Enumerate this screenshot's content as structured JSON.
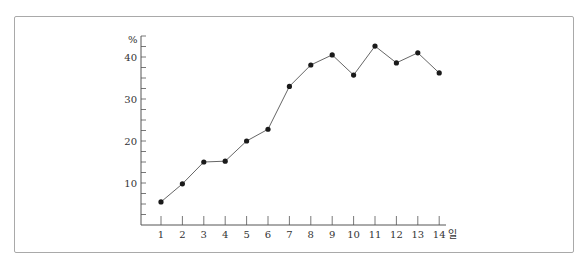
{
  "header": {
    "cut_text": ""
  },
  "chart_data": {
    "type": "line",
    "title": "",
    "xlabel": "일",
    "ylabel": "%",
    "x": [
      1,
      2,
      3,
      4,
      5,
      6,
      7,
      8,
      9,
      10,
      11,
      12,
      13,
      14
    ],
    "series": [
      {
        "name": "",
        "values": [
          5.5,
          9.8,
          15.0,
          15.2,
          20.0,
          22.8,
          33.0,
          38.1,
          40.5,
          35.7,
          42.6,
          38.6,
          41.0,
          36.2
        ]
      }
    ],
    "y_ticks": [
      10,
      20,
      30,
      40
    ],
    "x_tick_labels": [
      "1",
      "2",
      "3",
      "4",
      "5",
      "6",
      "7",
      "8",
      "9",
      "10",
      "11",
      "12",
      "13",
      "14"
    ],
    "ylim": [
      0,
      46
    ],
    "grid": false,
    "legend": "none",
    "minor_y_tick_step": 2.5
  },
  "colors": {
    "line": "#666666",
    "marker": "#1a1a1a",
    "axis": "#555555",
    "frame": "#a9a9a9"
  }
}
